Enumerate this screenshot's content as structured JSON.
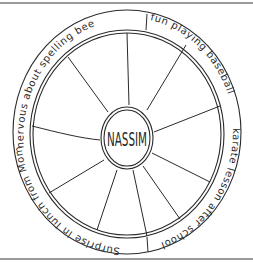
{
  "diagram": {
    "type": "wheel",
    "center_label": "NASSIM",
    "ring_labels": [
      {
        "id": "spelling",
        "text": "nervous about spelling bee"
      },
      {
        "id": "baseball",
        "text": "fun playing baseball"
      },
      {
        "id": "karate",
        "text": "karate lesson after school"
      },
      {
        "id": "lunch",
        "text": "Surprise in lunch from Mom"
      }
    ],
    "spoke_count": 10,
    "colors": {
      "stroke": "#2a2a2a",
      "background": "#ffffff",
      "frame": "#9a9a9a"
    }
  }
}
